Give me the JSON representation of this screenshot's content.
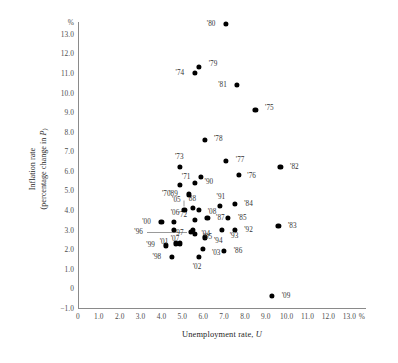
{
  "chart_data": {
    "type": "scatter",
    "title": "",
    "xlabel": "Unemployment rate, U",
    "ylabel": "Inflation rate (percentage change in P)",
    "x_unit": "%",
    "y_unit": "%",
    "xlim": [
      0,
      13.8
    ],
    "ylim": [
      -1.0,
      13.6
    ],
    "xticks": [
      "0",
      "1.0",
      "2.0",
      "3.0",
      "4.0",
      "5.0",
      "6.0",
      "7.0",
      "8.0",
      "9.0",
      "10.0",
      "11.0",
      "12.0",
      "13.0"
    ],
    "xtick_values": [
      0,
      1,
      2,
      3,
      4,
      5,
      6,
      7,
      8,
      9,
      10,
      11,
      12,
      13
    ],
    "yticks": [
      "13.0",
      "12.0",
      "11.0",
      "10.0",
      "9.0",
      "8.0",
      "7.0",
      "6.0",
      "5.0",
      "4.0",
      "3.0",
      "2.0",
      "1.0",
      "0",
      "-1.0"
    ],
    "ytick_values": [
      13,
      12,
      11,
      10,
      9,
      8,
      7,
      6,
      5,
      4,
      3,
      2,
      1,
      0,
      -1
    ],
    "grid": false,
    "legend": "none",
    "points": [
      {
        "label": "'70",
        "x": 4.9,
        "y": 5.3,
        "lx": -14,
        "ly": 9
      },
      {
        "label": "'71",
        "x": 5.9,
        "y": 5.7,
        "lx": -15,
        "ly": 0
      },
      {
        "label": "'72",
        "x": 5.6,
        "y": 3.5,
        "lx": -12,
        "ly": -5
      },
      {
        "label": "'73",
        "x": 4.9,
        "y": 6.2,
        "lx": -1,
        "ly": -10
      },
      {
        "label": "'74",
        "x": 5.6,
        "y": 11.0,
        "lx": -15,
        "ly": 0
      },
      {
        "label": "'75",
        "x": 8.5,
        "y": 9.1,
        "lx": 14,
        "ly": -2
      },
      {
        "label": "'76",
        "x": 7.7,
        "y": 5.8,
        "lx": 13,
        "ly": 1
      },
      {
        "label": "'77",
        "x": 7.1,
        "y": 6.5,
        "lx": 14,
        "ly": -1
      },
      {
        "label": "'78",
        "x": 6.1,
        "y": 7.6,
        "lx": 13,
        "ly": -1
      },
      {
        "label": "'79",
        "x": 5.8,
        "y": 11.3,
        "lx": 14,
        "ly": -3
      },
      {
        "label": "'80",
        "x": 7.1,
        "y": 13.5,
        "lx": -15,
        "ly": 0
      },
      {
        "label": "'81",
        "x": 7.6,
        "y": 10.4,
        "lx": -14,
        "ly": 0
      },
      {
        "label": "'82",
        "x": 9.7,
        "y": 6.2,
        "lx": 14,
        "ly": 0
      },
      {
        "label": "'83",
        "x": 9.6,
        "y": 3.2,
        "lx": 14,
        "ly": 0
      },
      {
        "label": "'84",
        "x": 7.5,
        "y": 4.3,
        "lx": 14,
        "ly": 0
      },
      {
        "label": "'85",
        "x": 7.2,
        "y": 3.6,
        "lx": 14,
        "ly": 0
      },
      {
        "label": "'86",
        "x": 7.0,
        "y": 1.9,
        "lx": 14,
        "ly": 0
      },
      {
        "label": "'87",
        "x": 6.2,
        "y": 3.6,
        "lx": 13,
        "ly": 0
      },
      {
        "label": "'88",
        "x": 5.5,
        "y": 4.1,
        "lx": -1,
        "ly": -9
      },
      {
        "label": "'89",
        "x": 5.3,
        "y": 4.8,
        "lx": -15,
        "ly": 0
      },
      {
        "label": "'90",
        "x": 5.6,
        "y": 5.4,
        "lx": 14,
        "ly": -1
      },
      {
        "label": "'91",
        "x": 6.8,
        "y": 4.2,
        "lx": 1,
        "ly": -9
      },
      {
        "label": "'92",
        "x": 7.5,
        "y": 3.0,
        "lx": 14,
        "ly": 0
      },
      {
        "label": "'93",
        "x": 6.9,
        "y": 3.0,
        "lx": 12,
        "ly": 6
      },
      {
        "label": "'94",
        "x": 6.1,
        "y": 2.6,
        "lx": 13,
        "ly": 4
      },
      {
        "label": "'95",
        "x": 5.6,
        "y": 2.8,
        "lx": 13,
        "ly": 3
      },
      {
        "label": "'96",
        "x": 5.4,
        "y": 2.9,
        "lx": -52,
        "ly": 0,
        "leader": true
      },
      {
        "label": "'97",
        "x": 4.9,
        "y": 2.3,
        "lx": -1,
        "ly": -10
      },
      {
        "label": "'98",
        "x": 4.5,
        "y": 1.6,
        "lx": -15,
        "ly": 0
      },
      {
        "label": "'99",
        "x": 4.2,
        "y": 2.2,
        "lx": -15,
        "ly": 0
      },
      {
        "label": "'00",
        "x": 4.0,
        "y": 3.4,
        "lx": -15,
        "ly": 0
      },
      {
        "label": "'01",
        "x": 4.7,
        "y": 2.3,
        "lx": -12,
        "ly": -1
      },
      {
        "label": "'02",
        "x": 5.8,
        "y": 1.6,
        "lx": -2,
        "ly": 10
      },
      {
        "label": "'03",
        "x": 6.0,
        "y": 2.0,
        "lx": 13,
        "ly": 4
      },
      {
        "label": "'04",
        "x": 5.5,
        "y": 3.0,
        "lx": 13,
        "ly": 4
      },
      {
        "label": "'05",
        "x": 5.1,
        "y": 4.0,
        "lx": -8,
        "ly": -10,
        "leader": true
      },
      {
        "label": "'06",
        "x": 4.6,
        "y": 3.4,
        "lx": 1,
        "ly": -9
      },
      {
        "label": "'07",
        "x": 4.6,
        "y": 3.0,
        "lx": 1,
        "ly": 9
      },
      {
        "label": "'08",
        "x": 5.8,
        "y": 4.0,
        "lx": 13,
        "ly": 2
      },
      {
        "label": "'09",
        "x": 9.3,
        "y": -0.4,
        "lx": 14,
        "ly": 0
      }
    ]
  }
}
